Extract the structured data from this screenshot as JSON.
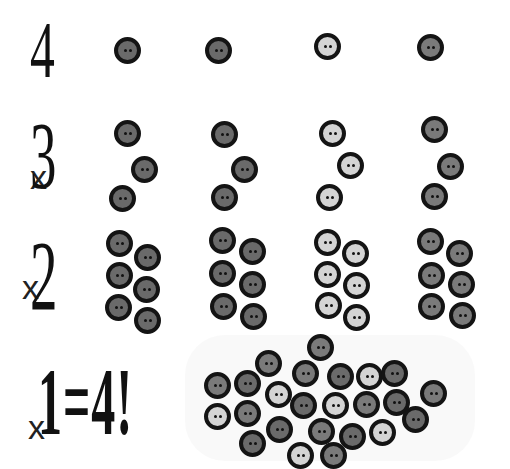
{
  "rows": [
    {
      "label": "4",
      "prefix": ""
    },
    {
      "label": "3",
      "prefix": "x"
    },
    {
      "label": "2",
      "prefix": "x"
    },
    {
      "label": "1=4!",
      "prefix": "x"
    }
  ],
  "colors": {
    "dark_button": "#6a6a6a",
    "light_button": "#d4d4d4",
    "rim": "#141414",
    "background": "#ffffff"
  },
  "buttons": {
    "row1": [
      {
        "x": 127,
        "y": 50,
        "tone": "dark"
      },
      {
        "x": 218,
        "y": 50,
        "tone": "dark"
      },
      {
        "x": 327,
        "y": 46,
        "tone": "light"
      },
      {
        "x": 430,
        "y": 47,
        "tone": "mid"
      }
    ],
    "row2": [
      {
        "x": 127,
        "y": 133,
        "tone": "dark"
      },
      {
        "x": 144,
        "y": 169,
        "tone": "dark"
      },
      {
        "x": 122,
        "y": 198,
        "tone": "dark"
      },
      {
        "x": 224,
        "y": 134,
        "tone": "dark"
      },
      {
        "x": 244,
        "y": 169,
        "tone": "dark"
      },
      {
        "x": 224,
        "y": 197,
        "tone": "dark"
      },
      {
        "x": 332,
        "y": 133,
        "tone": "light"
      },
      {
        "x": 350,
        "y": 165,
        "tone": "light"
      },
      {
        "x": 329,
        "y": 197,
        "tone": "light"
      },
      {
        "x": 434,
        "y": 129,
        "tone": "mid"
      },
      {
        "x": 450,
        "y": 166,
        "tone": "mid"
      },
      {
        "x": 434,
        "y": 196,
        "tone": "mid"
      }
    ],
    "row3": [
      {
        "x": 119,
        "y": 243,
        "tone": "dark"
      },
      {
        "x": 147,
        "y": 257,
        "tone": "dark"
      },
      {
        "x": 119,
        "y": 275,
        "tone": "dark"
      },
      {
        "x": 146,
        "y": 289,
        "tone": "dark"
      },
      {
        "x": 118,
        "y": 307,
        "tone": "dark"
      },
      {
        "x": 147,
        "y": 320,
        "tone": "dark"
      },
      {
        "x": 222,
        "y": 240,
        "tone": "dark"
      },
      {
        "x": 252,
        "y": 251,
        "tone": "dark"
      },
      {
        "x": 222,
        "y": 273,
        "tone": "dark"
      },
      {
        "x": 252,
        "y": 284,
        "tone": "dark"
      },
      {
        "x": 223,
        "y": 306,
        "tone": "dark"
      },
      {
        "x": 253,
        "y": 316,
        "tone": "dark"
      },
      {
        "x": 327,
        "y": 242,
        "tone": "light"
      },
      {
        "x": 355,
        "y": 253,
        "tone": "light"
      },
      {
        "x": 327,
        "y": 274,
        "tone": "light"
      },
      {
        "x": 356,
        "y": 285,
        "tone": "light"
      },
      {
        "x": 328,
        "y": 305,
        "tone": "light"
      },
      {
        "x": 356,
        "y": 317,
        "tone": "light"
      },
      {
        "x": 430,
        "y": 241,
        "tone": "mid"
      },
      {
        "x": 459,
        "y": 253,
        "tone": "mid"
      },
      {
        "x": 431,
        "y": 275,
        "tone": "mid"
      },
      {
        "x": 461,
        "y": 284,
        "tone": "mid"
      },
      {
        "x": 431,
        "y": 306,
        "tone": "mid"
      },
      {
        "x": 462,
        "y": 315,
        "tone": "mid"
      }
    ],
    "pile": [
      {
        "x": 320,
        "y": 347,
        "tone": "mid"
      },
      {
        "x": 268,
        "y": 363,
        "tone": "mid"
      },
      {
        "x": 217,
        "y": 385,
        "tone": "mid"
      },
      {
        "x": 247,
        "y": 383,
        "tone": "dark"
      },
      {
        "x": 305,
        "y": 373,
        "tone": "mid"
      },
      {
        "x": 340,
        "y": 376,
        "tone": "dark"
      },
      {
        "x": 369,
        "y": 376,
        "tone": "light"
      },
      {
        "x": 394,
        "y": 373,
        "tone": "dark"
      },
      {
        "x": 433,
        "y": 393,
        "tone": "mid"
      },
      {
        "x": 217,
        "y": 416,
        "tone": "light"
      },
      {
        "x": 247,
        "y": 413,
        "tone": "mid"
      },
      {
        "x": 278,
        "y": 394,
        "tone": "light"
      },
      {
        "x": 303,
        "y": 405,
        "tone": "dark"
      },
      {
        "x": 335,
        "y": 405,
        "tone": "light"
      },
      {
        "x": 366,
        "y": 404,
        "tone": "mid"
      },
      {
        "x": 396,
        "y": 402,
        "tone": "dark"
      },
      {
        "x": 252,
        "y": 443,
        "tone": "dark"
      },
      {
        "x": 279,
        "y": 429,
        "tone": "dark"
      },
      {
        "x": 321,
        "y": 431,
        "tone": "mid"
      },
      {
        "x": 352,
        "y": 436,
        "tone": "dark"
      },
      {
        "x": 382,
        "y": 432,
        "tone": "light"
      },
      {
        "x": 415,
        "y": 419,
        "tone": "dark"
      },
      {
        "x": 300,
        "y": 455,
        "tone": "light"
      },
      {
        "x": 333,
        "y": 455,
        "tone": "mid"
      }
    ]
  }
}
